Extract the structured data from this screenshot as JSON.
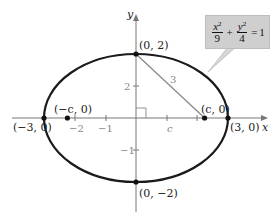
{
  "diagram": {
    "type": "ellipse-graph",
    "equation": {
      "term1_num_var": "x",
      "term1_num_exp": "2",
      "term1_den": "9",
      "plus": "+",
      "term2_num_var": "y",
      "term2_num_exp": "2",
      "term2_den": "4",
      "equals": "=",
      "rhs": "1"
    },
    "axes": {
      "x_label": "x",
      "y_label": "y",
      "x_ticks": [
        "-2",
        "-1"
      ],
      "y_ticks": [
        "2",
        "-1",
        "1"
      ]
    },
    "points": {
      "top": "(0, 2)",
      "bottom": "(0, −2)",
      "left_vertex": "(−3, 0)",
      "right_vertex": "(3, 0)",
      "focus_left": "(−c, 0)",
      "focus_right": "(c, 0)"
    },
    "segment_labels": {
      "hypotenuse": "3",
      "base": "c",
      "height": "2"
    },
    "x_tick_labels": {
      "neg2": "−2",
      "neg1": "−1"
    },
    "y_tick_labels": {
      "pos2": "2",
      "neg1": "−1"
    },
    "colors": {
      "curve": "#1a1a1a",
      "axis": "#777777",
      "segment": "#8a8a8a",
      "callout_bg": "#cfcfcf"
    }
  }
}
